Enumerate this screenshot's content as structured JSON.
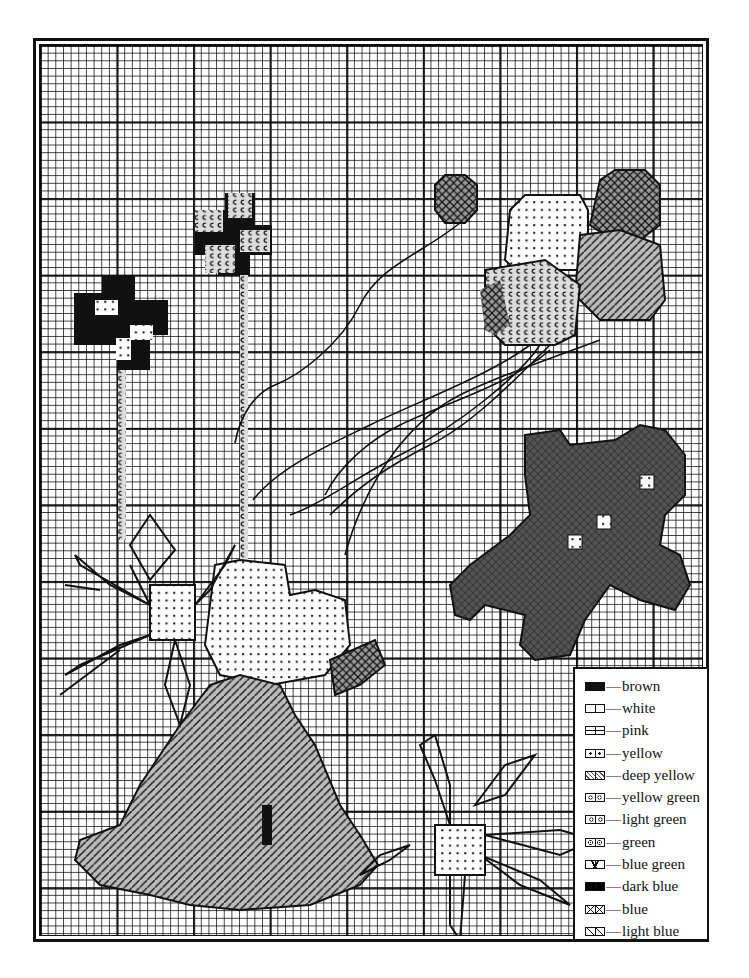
{
  "chart": {
    "title": "",
    "type": "cross-stitch pattern chart"
  },
  "legend": {
    "items": [
      {
        "symbol": "solid-brown",
        "label": "brown"
      },
      {
        "symbol": "blank",
        "label": "white"
      },
      {
        "symbol": "dash",
        "label": "pink"
      },
      {
        "symbol": "dot",
        "label": "yellow"
      },
      {
        "symbol": "dot-slash",
        "label": "deep yellow"
      },
      {
        "symbol": "double-circle",
        "label": "yellow green"
      },
      {
        "symbol": "c-hook",
        "label": "light green"
      },
      {
        "symbol": "circle-dot",
        "label": "green"
      },
      {
        "symbol": "v-mark",
        "label": "blue green"
      },
      {
        "symbol": "solid-dark",
        "label": "dark blue"
      },
      {
        "symbol": "x-mark",
        "label": "blue"
      },
      {
        "symbol": "diagonal",
        "label": "light blue"
      }
    ],
    "separator": "—"
  },
  "colors": {
    "ink": "#111111",
    "paper": "#ffffff",
    "shade": "#555555"
  }
}
